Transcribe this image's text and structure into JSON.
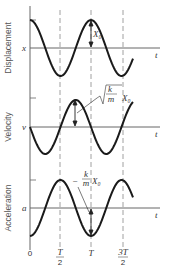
{
  "diagram": {
    "type": "simple-harmonic-motion-plots",
    "time_axis_label": "t",
    "time_ticks": [
      "0",
      "T/2",
      "T",
      "3T/2"
    ],
    "panels": [
      {
        "name": "displacement",
        "ylabel": "Displacement",
        "axis_symbol": "x",
        "amplitude_label": "X₀",
        "function": "cos"
      },
      {
        "name": "velocity",
        "ylabel": "Velocity",
        "axis_symbol": "v",
        "amplitude_label": "√(k/m) X₀",
        "amp_frac_num": "k",
        "amp_frac_den": "m",
        "amp_suffix": "X₀",
        "function": "-sin"
      },
      {
        "name": "acceleration",
        "ylabel": "Acceleration",
        "axis_symbol": "a",
        "amplitude_label": "-(k/m) X₀",
        "amp_prefix": "−",
        "amp_frac_num": "k",
        "amp_frac_den": "m",
        "amp_suffix": "X₀",
        "function": "-cos"
      }
    ],
    "colors": {
      "curve": "#1a1a1a",
      "axis": "#666666",
      "dashed": "#888888",
      "text": "#444444"
    }
  }
}
